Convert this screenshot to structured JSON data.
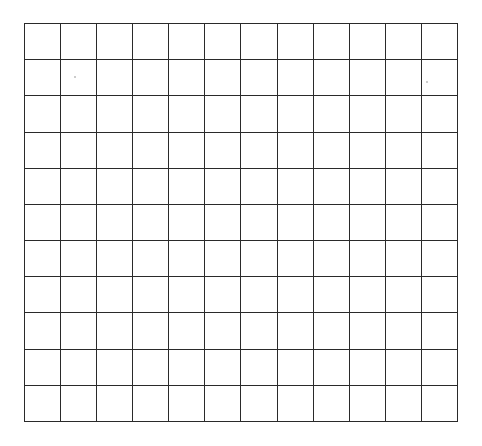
{
  "grid": {
    "rows": 11,
    "columns": 12,
    "line_color": "#2a2a2a",
    "background": "#ffffff"
  }
}
